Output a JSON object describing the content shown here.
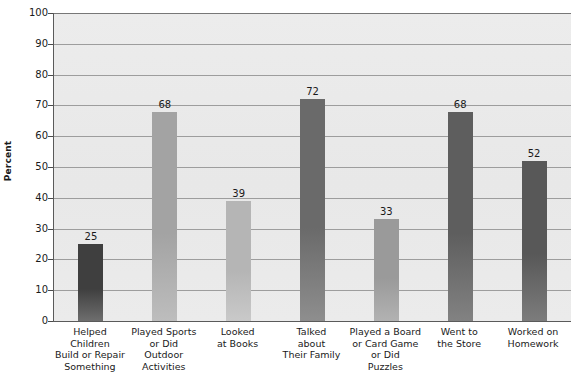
{
  "chart_data": {
    "type": "bar",
    "title": "",
    "xlabel": "",
    "ylabel": "Percent",
    "ylim": [
      0,
      100
    ],
    "ytick_step": 10,
    "yticks": [
      0,
      10,
      20,
      30,
      40,
      50,
      60,
      70,
      80,
      90,
      100
    ],
    "ytick_labels": [
      "0",
      "10",
      "20",
      "30",
      "40",
      "50",
      "60",
      "70",
      "80",
      "90",
      "100"
    ],
    "grid": true,
    "grid_axis": "y",
    "legend": "none",
    "categories": [
      "Helped Children Build or Repair Something",
      "Played Sports or Did Outdoor Activities",
      "Looked at Books",
      "Talked about Their Family",
      "Played a Board or Card Game or Did Puzzles",
      "Went to the Store",
      "Worked on Homework"
    ],
    "category_label_lines": [
      [
        "Helped",
        "Children",
        "Build or Repair",
        "Something"
      ],
      [
        "Played Sports",
        "or Did",
        "Outdoor",
        "Activities"
      ],
      [
        "Looked",
        "at Books"
      ],
      [
        "Talked",
        "about",
        "Their Family"
      ],
      [
        "Played a Board",
        "or Card Game",
        "or Did",
        "Puzzles"
      ],
      [
        "Went to",
        "the Store"
      ],
      [
        "Worked on",
        "Homework"
      ]
    ],
    "values": [
      25,
      68,
      39,
      72,
      33,
      68,
      52
    ],
    "value_labels": [
      "25",
      "68",
      "39",
      "72",
      "33",
      "68",
      "52"
    ],
    "bar_colors": [
      "#3f3f3f",
      "#a3a3a3",
      "#b5b5b5",
      "#6a6a6a",
      "#9a9a9a",
      "#5e5e5e",
      "#585858"
    ],
    "bar_colors_bottom": [
      "#6e6e6e",
      "#bdbdbd",
      "#c9c9c9",
      "#8e8e8e",
      "#b2b2b2",
      "#828282",
      "#7c7c7c"
    ]
  },
  "style": {
    "plot_background": "#eaeaea",
    "gridline_color": "#9d9d9d",
    "axis_color": "#5a5a5a",
    "text_color": "#1a1a1a",
    "page_background": "#ffffff"
  }
}
